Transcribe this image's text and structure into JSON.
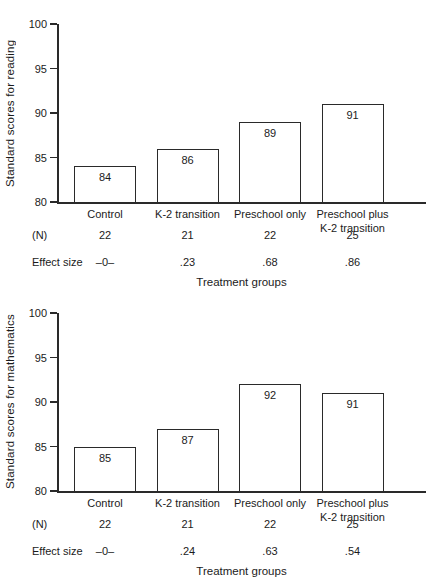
{
  "figure": {
    "background": "#ffffff",
    "text_color": "#1b1b1b",
    "line_color": "#2a2a2a",
    "bar_fill": "#ffffff"
  },
  "chart_data": [
    {
      "type": "bar",
      "title": "",
      "ylabel": "Standard scores for reading",
      "xlabel": "Treatment groups",
      "ylim": [
        80,
        100
      ],
      "yticks": [
        80,
        85,
        90,
        95,
        100
      ],
      "grid": false,
      "legend": "none",
      "categories": [
        "Control",
        "K-2 transition",
        "Preschool only",
        "Preschool plus\nK-2 transition"
      ],
      "values": [
        84,
        86,
        89,
        91
      ],
      "bar_labels": [
        "84",
        "86",
        "89",
        "91"
      ],
      "n_label": "(N)",
      "n_values": [
        "22",
        "21",
        "22",
        "25"
      ],
      "effect_size_label": "Effect size",
      "effect_size_values": [
        "–0–",
        ".23",
        ".68",
        ".86"
      ]
    },
    {
      "type": "bar",
      "title": "",
      "ylabel": "Standard scores for mathematics",
      "xlabel": "Treatment groups",
      "ylim": [
        80,
        100
      ],
      "yticks": [
        80,
        85,
        90,
        95,
        100
      ],
      "grid": false,
      "legend": "none",
      "categories": [
        "Control",
        "K-2 transition",
        "Preschool only",
        "Preschool plus\nK-2 transition"
      ],
      "values": [
        85,
        87,
        92,
        91
      ],
      "bar_labels": [
        "85",
        "87",
        "92",
        "91"
      ],
      "n_label": "(N)",
      "n_values": [
        "22",
        "21",
        "22",
        "25"
      ],
      "effect_size_label": "Effect size",
      "effect_size_values": [
        "–0–",
        ".24",
        ".63",
        ".54"
      ]
    }
  ]
}
